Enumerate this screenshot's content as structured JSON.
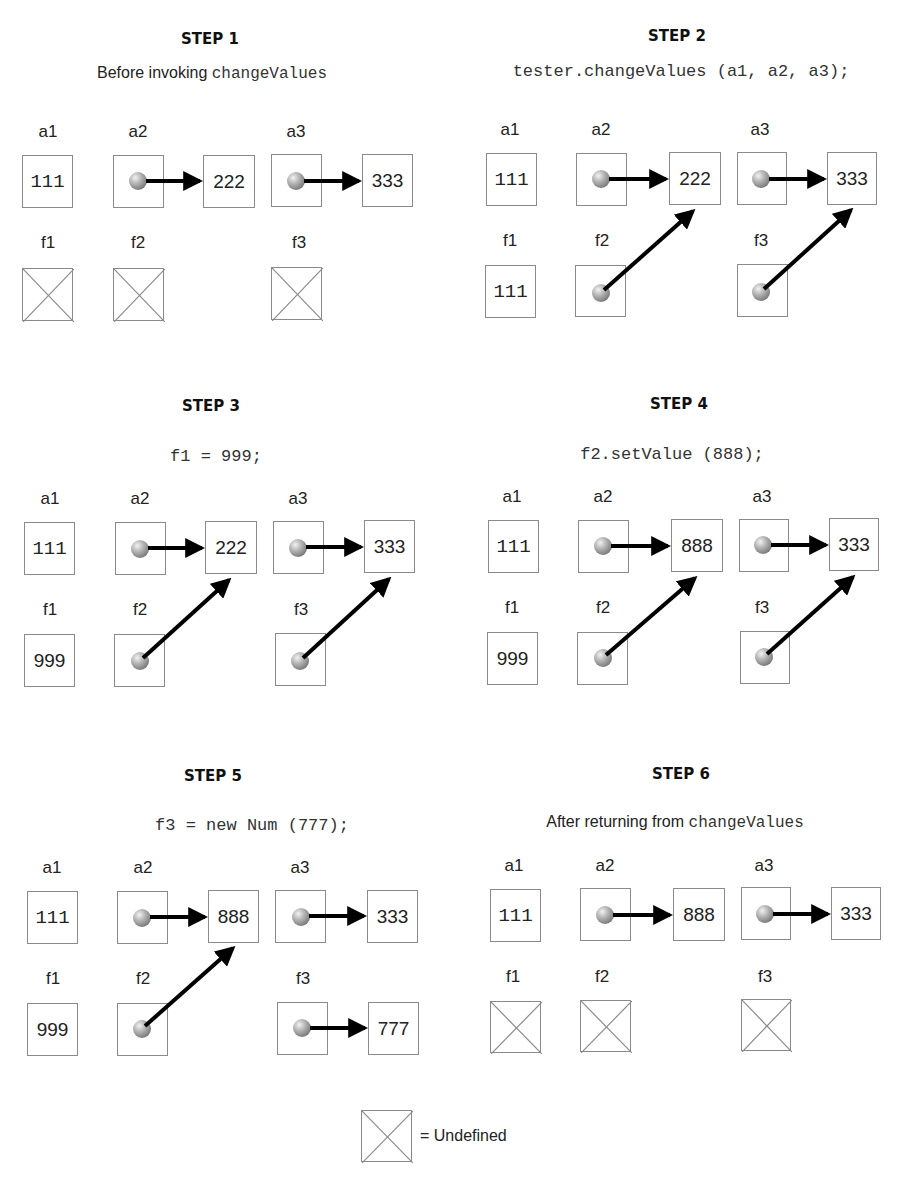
{
  "legend": {
    "symbol": "undefined-box",
    "label": "= Undefined"
  },
  "steps": [
    {
      "title": "STEP 1",
      "caption_text": "Before invoking ",
      "caption_code": "changeValues",
      "labels": {
        "a1": "a1",
        "a2": "a2",
        "a3": "a3",
        "f1": "f1",
        "f2": "f2",
        "f3": "f3"
      },
      "a1": "111",
      "a2_target": "222",
      "a3_target": "333",
      "f1": "undefined",
      "f2": "undefined",
      "f3": "undefined"
    },
    {
      "title": "STEP 2",
      "code": "tester.changeValues (a1, a2, a3);",
      "labels": {
        "a1": "a1",
        "a2": "a2",
        "a3": "a3",
        "f1": "f1",
        "f2": "f2",
        "f3": "f3"
      },
      "a1": "111",
      "a2_target": "222",
      "a3_target": "333",
      "f1": "111",
      "f2": "ref -> a2 target",
      "f3": "ref -> a3 target"
    },
    {
      "title": "STEP 3",
      "code": "f1 = 999;",
      "labels": {
        "a1": "a1",
        "a2": "a2",
        "a3": "a3",
        "f1": "f1",
        "f2": "f2",
        "f3": "f3"
      },
      "a1": "111",
      "a2_target": "222",
      "a3_target": "333",
      "f1": "999",
      "f2": "ref -> a2 target",
      "f3": "ref -> a3 target"
    },
    {
      "title": "STEP 4",
      "code": "f2.setValue (888);",
      "labels": {
        "a1": "a1",
        "a2": "a2",
        "a3": "a3",
        "f1": "f1",
        "f2": "f2",
        "f3": "f3"
      },
      "a1": "111",
      "a2_target": "888",
      "a3_target": "333",
      "f1": "999",
      "f2": "ref -> a2 target",
      "f3": "ref -> a3 target"
    },
    {
      "title": "STEP 5",
      "code": "f3 = new Num (777);",
      "labels": {
        "a1": "a1",
        "a2": "a2",
        "a3": "a3",
        "f1": "f1",
        "f2": "f2",
        "f3": "f3"
      },
      "a1": "111",
      "a2_target": "888",
      "a3_target": "333",
      "f1": "999",
      "f2": "ref -> a2 target",
      "f3_target": "777"
    },
    {
      "title": "STEP 6",
      "caption_text": "After returning from ",
      "caption_code": "changeValues",
      "labels": {
        "a1": "a1",
        "a2": "a2",
        "a3": "a3",
        "f1": "f1",
        "f2": "f2",
        "f3": "f3"
      },
      "a1": "111",
      "a2_target": "888",
      "a3_target": "333",
      "f1": "undefined",
      "f2": "undefined",
      "f3": "undefined"
    }
  ]
}
